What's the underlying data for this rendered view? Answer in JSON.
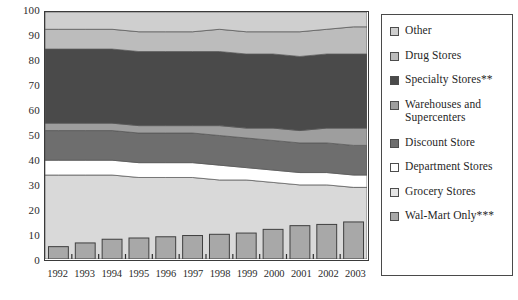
{
  "chart_data": {
    "type": "area",
    "title": "",
    "xlabel": "",
    "ylabel": "",
    "ylim": [
      0,
      100
    ],
    "ytick_values": [
      0,
      10,
      20,
      30,
      40,
      50,
      60,
      70,
      80,
      90,
      100
    ],
    "ytick_labels": [
      "0",
      "10",
      "20",
      "30",
      "40",
      "50",
      "60",
      "70",
      "80",
      "90",
      "100"
    ],
    "grid": false,
    "legend_position": "right",
    "categories": [
      "1992",
      "1993",
      "1994",
      "1995",
      "1996",
      "1997",
      "1998",
      "1999",
      "2000",
      "2001",
      "2002",
      "2003"
    ],
    "stack_order_bottom_to_top": [
      "Grocery Stores",
      "Department Stores",
      "Discount Store",
      "Warehouses and Supercenters",
      "Specialty Stores**",
      "Drug Stores",
      "Other"
    ],
    "series": [
      {
        "name": "Grocery Stores",
        "color": "#d9d9d9",
        "values": [
          34,
          34,
          34,
          33,
          33,
          33,
          32,
          32,
          31,
          30,
          30,
          29
        ]
      },
      {
        "name": "Department Stores",
        "color": "#ffffff",
        "values": [
          6,
          6,
          6,
          6,
          6,
          6,
          6,
          5,
          5,
          5,
          5,
          5
        ]
      },
      {
        "name": "Discount Store",
        "color": "#6e6e6e",
        "values": [
          12,
          12,
          12,
          12,
          12,
          12,
          12,
          12,
          12,
          12,
          12,
          12
        ]
      },
      {
        "name": "Warehouses and Supercenters",
        "color": "#9e9e9e",
        "values": [
          3,
          3,
          3,
          3,
          3,
          3,
          4,
          4,
          5,
          5,
          6,
          7
        ]
      },
      {
        "name": "Specialty Stores**",
        "color": "#4a4a4a",
        "values": [
          30,
          30,
          30,
          30,
          30,
          30,
          30,
          30,
          30,
          30,
          30,
          30
        ]
      },
      {
        "name": "Drug Stores",
        "color": "#bcbcbc",
        "values": [
          8,
          8,
          8,
          8,
          8,
          8,
          9,
          9,
          9,
          10,
          10,
          11
        ]
      },
      {
        "name": "Other",
        "color": "#cfcfcf",
        "values": [
          7,
          7,
          7,
          8,
          8,
          8,
          7,
          8,
          8,
          8,
          7,
          6
        ]
      }
    ],
    "bar_series": {
      "name": "Wal-Mart Only***",
      "color": "#a8a8a8",
      "values": [
        5,
        6.5,
        8,
        8.5,
        9,
        9.5,
        10,
        10.5,
        12,
        13.5,
        14,
        15
      ]
    },
    "stack_boundaries": {
      "note": "cumulative tops, bottom-to-top, per year",
      "Grocery Stores": [
        34,
        34,
        34,
        33,
        33,
        33,
        32,
        32,
        31,
        30,
        30,
        29
      ],
      "Department Stores": [
        40,
        40,
        40,
        39,
        39,
        39,
        38,
        37,
        36,
        35,
        35,
        34
      ],
      "Discount Store": [
        52,
        52,
        52,
        51,
        51,
        51,
        50,
        49,
        48,
        47,
        47,
        46
      ],
      "Warehouses and Supercenters": [
        55,
        55,
        55,
        54,
        54,
        54,
        54,
        53,
        53,
        52,
        53,
        53
      ],
      "Specialty Stores**": [
        85,
        85,
        85,
        84,
        84,
        84,
        84,
        83,
        83,
        82,
        83,
        83
      ],
      "Drug Stores": [
        93,
        93,
        93,
        92,
        92,
        92,
        93,
        92,
        92,
        92,
        93,
        94
      ],
      "Other": [
        100,
        100,
        100,
        100,
        100,
        100,
        100,
        100,
        100,
        100,
        100,
        100
      ]
    }
  },
  "legend": {
    "items": [
      {
        "label": "Other",
        "color": "#cfcfcf"
      },
      {
        "label": "Drug Stores",
        "color": "#bcbcbc"
      },
      {
        "label": "Specialty Stores**",
        "color": "#4a4a4a"
      },
      {
        "label": "Warehouses and\nSupercenters",
        "color": "#9e9e9e"
      },
      {
        "label": "Discount Store",
        "color": "#6e6e6e"
      },
      {
        "label": "Department Stores",
        "color": "#ffffff"
      },
      {
        "label": "Grocery Stores",
        "color": "#e6e6e6"
      },
      {
        "label": "Wal-Mart Only***",
        "color": "#a8a8a8"
      }
    ]
  },
  "axes": {
    "y_labels": [
      "100",
      "90",
      "80",
      "70",
      "60",
      "50",
      "40",
      "30",
      "20",
      "10",
      "0"
    ],
    "x_labels": [
      "1992",
      "1993",
      "1994",
      "1995",
      "1996",
      "1997",
      "1998",
      "1999",
      "2000",
      "2001",
      "2002",
      "2003"
    ]
  }
}
